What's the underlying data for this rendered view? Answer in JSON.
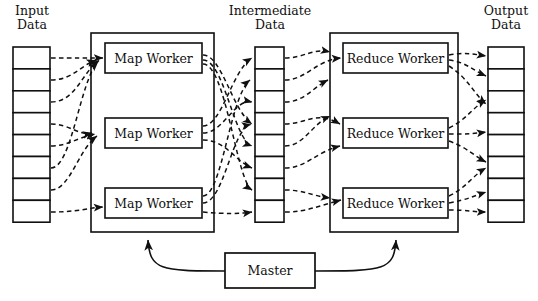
{
  "diagram": {
    "columns": {
      "input": {
        "label_line1": "Input",
        "label_line2": "Data",
        "cells": 8
      },
      "intermediate": {
        "label_line1": "Intermediate",
        "label_line2": "Data",
        "cells": 8
      },
      "output": {
        "label_line1": "Output",
        "label_line2": "Data",
        "cells": 8
      }
    },
    "map_workers": [
      {
        "label": "Map Worker"
      },
      {
        "label": "Map Worker"
      },
      {
        "label": "Map Worker"
      }
    ],
    "reduce_workers": [
      {
        "label": "Reduce Worker"
      },
      {
        "label": "Reduce Worker"
      },
      {
        "label": "Reduce Worker"
      }
    ],
    "master": {
      "label": "Master"
    },
    "colors": {
      "stroke": "#101010",
      "background": "#ffffff",
      "fill": "#ffffff"
    },
    "edges": {
      "input_to_map": "dashed",
      "map_to_intermediate": "dashed",
      "intermediate_to_reduce": "dashed",
      "reduce_to_output": "dashed",
      "master_to_groups": "solid"
    }
  }
}
